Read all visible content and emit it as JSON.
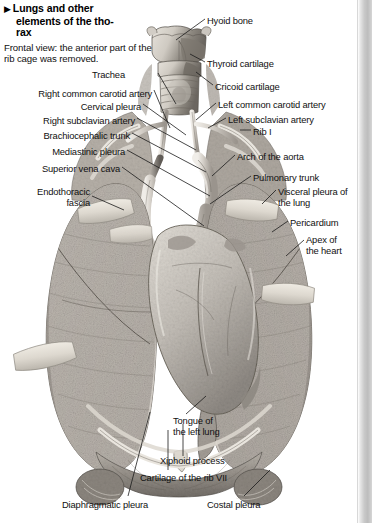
{
  "caption": {
    "bullet": "▶",
    "title_lines": [
      "Lungs and other",
      "elements of the tho-",
      "rax"
    ],
    "subtitle": "Frontal view: the anterior part of the rib cage was removed."
  },
  "figure": {
    "view": "Frontal view"
  },
  "labels": [
    {
      "id": "hyoid-bone",
      "text": "Hyoid bone",
      "x": 207,
      "y": 16,
      "align": "left"
    },
    {
      "id": "thyroid-cartilage",
      "text": "Thyroid cartilage",
      "x": 207,
      "y": 59,
      "align": "left"
    },
    {
      "id": "cricoid-cartilage",
      "text": "Cricoid cartilage",
      "x": 215,
      "y": 82,
      "align": "left"
    },
    {
      "id": "trachea",
      "text": "Trachea",
      "x": 125,
      "y": 70,
      "align": "right"
    },
    {
      "id": "right-common-carotid",
      "text": "Right common carotid artery",
      "x": 152,
      "y": 89,
      "align": "right"
    },
    {
      "id": "left-common-carotid",
      "text": "Left common carotid artery",
      "x": 218,
      "y": 100,
      "align": "left"
    },
    {
      "id": "cervical-pleura",
      "text": "Cervical pleura",
      "x": 141,
      "y": 102,
      "align": "right"
    },
    {
      "id": "left-subclavian-artery",
      "text": "Left subclavian artery",
      "x": 228,
      "y": 115,
      "align": "left"
    },
    {
      "id": "right-subclavian-artery",
      "text": "Right subclavian artery",
      "x": 135,
      "y": 116,
      "align": "right"
    },
    {
      "id": "rib-i",
      "text": "Rib I",
      "x": 253,
      "y": 127,
      "align": "left"
    },
    {
      "id": "brachiocephalic-trunk",
      "text": "Brachiocephalic trunk",
      "x": 130,
      "y": 131,
      "align": "right"
    },
    {
      "id": "arch-of-the-aorta",
      "text": "Arch of the aorta",
      "x": 237,
      "y": 152,
      "align": "left"
    },
    {
      "id": "mediastinic-pleura",
      "text": "Mediastinic pleura",
      "x": 125,
      "y": 147,
      "align": "right"
    },
    {
      "id": "pulmonary-trunk",
      "text": "Pulmonary trunk",
      "x": 253,
      "y": 173,
      "align": "left"
    },
    {
      "id": "superior-vena-cava",
      "text": "Superior vena cava",
      "x": 120,
      "y": 164,
      "align": "right"
    },
    {
      "id": "visceral-pleura-of-lung",
      "text": "Visceral pleura of\nthe lung",
      "x": 278,
      "y": 187,
      "align": "left"
    },
    {
      "id": "endothoracic-fascia",
      "text": "Endothoracic\nfascia",
      "x": 90,
      "y": 187,
      "align": "right"
    },
    {
      "id": "pericardium",
      "text": "Pericardium",
      "x": 290,
      "y": 218,
      "align": "left"
    },
    {
      "id": "apex-of-the-heart",
      "text": "Apex of\nthe heart",
      "x": 306,
      "y": 235,
      "align": "left"
    },
    {
      "id": "tongue-of-the-left-lung",
      "text": "Tongue of\nthe left lung",
      "x": 173,
      "y": 416,
      "align": "left"
    },
    {
      "id": "xiphoid-process",
      "text": "Xiphoid process",
      "x": 160,
      "y": 456,
      "align": "left"
    },
    {
      "id": "cartilage-of-the-rib-vii",
      "text": "Cartilage of the rib VII",
      "x": 140,
      "y": 473,
      "align": "left"
    },
    {
      "id": "diaphragmatic-pleura",
      "text": "Diaphragmatic pleura",
      "x": 62,
      "y": 500,
      "align": "left"
    },
    {
      "id": "costal-pleura",
      "text": "Costal pleura",
      "x": 207,
      "y": 500,
      "align": "left"
    }
  ],
  "colors": {
    "background": "#ffffff",
    "text": "#111111",
    "leader_line": "#1b1b1b",
    "page_edge": "#c9c9c9",
    "tissue_light": "#d8d3cc",
    "tissue_mid": "#a9a39c",
    "tissue_dark": "#6f6a64",
    "flap": "#ded9d0"
  }
}
